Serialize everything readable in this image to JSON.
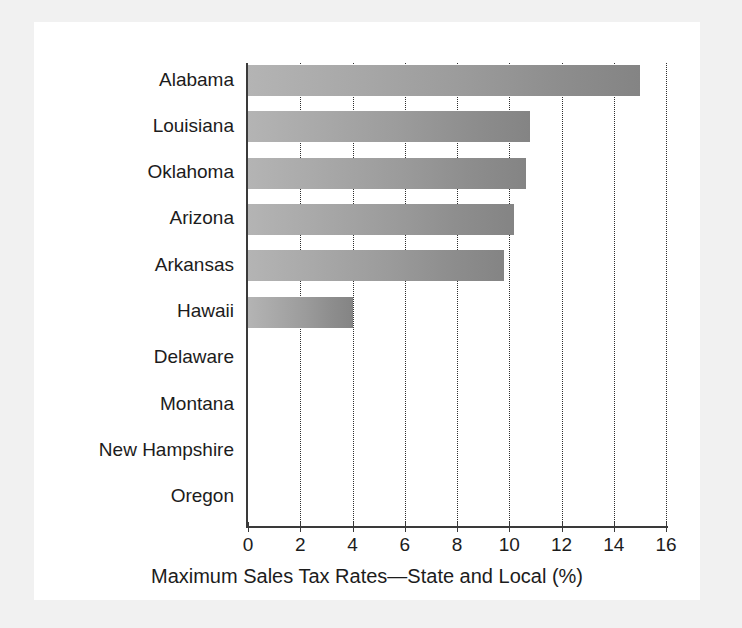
{
  "chart_data": {
    "type": "bar",
    "orientation": "horizontal",
    "title": "",
    "xlabel": "Maximum Sales Tax Rates—State and Local (%)",
    "ylabel": "",
    "categories": [
      "Alabama",
      "Louisiana",
      "Oklahoma",
      "Arizona",
      "Arkansas",
      "Hawaii",
      "Delaware",
      "Montana",
      "New Hampshire",
      "Oregon"
    ],
    "values": [
      15.0,
      10.8,
      10.65,
      10.2,
      9.8,
      4.0,
      0,
      0,
      0,
      0
    ],
    "xlim": [
      0,
      16
    ],
    "xticks": [
      0,
      2,
      4,
      6,
      8,
      10,
      12,
      14,
      16
    ],
    "xtick_labels": [
      "0",
      "2",
      "4",
      "6",
      "8",
      "10",
      "12",
      "14",
      "16"
    ],
    "grid": "vertical-dotted",
    "legend": "none",
    "bar_color_light": "#b4b4b4",
    "bar_color_dark": "#848484",
    "axis_color": "#3a3a3a",
    "text_color": "#1c1c1c",
    "background": "#ffffff",
    "frame_color": "#f1f1f1"
  }
}
